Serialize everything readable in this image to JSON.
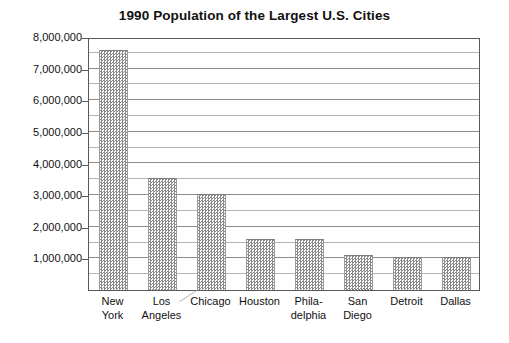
{
  "chart_data": {
    "type": "bar",
    "title": "1990 Population of the Largest U.S. Cities",
    "xlabel": "",
    "ylabel": "",
    "categories": [
      "New York",
      "Los Angeles",
      "Chicago",
      "Houston",
      "Phila-delphia",
      "San Diego",
      "Detroit",
      "Dallas"
    ],
    "category_lines": [
      [
        "New",
        "York"
      ],
      [
        "Los",
        "Angeles"
      ],
      [
        "Chicago"
      ],
      [
        "Houston"
      ],
      [
        "Phila-",
        "delphia"
      ],
      [
        "San",
        "Diego"
      ],
      [
        "Detroit"
      ],
      [
        "Dallas"
      ]
    ],
    "values": [
      7600000,
      3550000,
      3050000,
      1600000,
      1600000,
      1100000,
      1050000,
      1050000
    ],
    "ylim": [
      0,
      8000000
    ],
    "y_tick_labels": [
      "8,000,000",
      "7,000,000",
      "6,000,000",
      "5,000,000",
      "4,000,000",
      "3,000,000",
      "2,000,000",
      "1,000,000"
    ],
    "y_tick_values": [
      8000000,
      7000000,
      6000000,
      5000000,
      4000000,
      3000000,
      2000000,
      1000000
    ],
    "y_major_step": 1000000,
    "y_minor_step": 500000,
    "grid": true,
    "legend": false,
    "bar_fill": "#8a8a8a",
    "bar_pattern": "checkerboard-dither",
    "axis_color": "#5a5a5a",
    "gridline_color": "#8c8c8c",
    "background": "#ffffff"
  }
}
